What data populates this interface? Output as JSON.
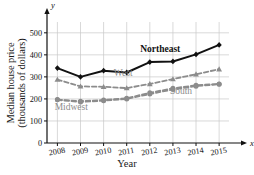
{
  "chart_data": {
    "type": "line",
    "title": "",
    "xlabel": "Year",
    "ylabel": "Median house price (thousands of dollars)",
    "ylabel_line1": "Median house price",
    "ylabel_line2": "(thousands of dollars)",
    "x_axis_symbol": "x",
    "y_axis_symbol": "y",
    "categories": [
      "2008",
      "2009",
      "2010",
      "2011",
      "2012",
      "2013",
      "2014",
      "2015"
    ],
    "x": [
      2008,
      2009,
      2010,
      2011,
      2012,
      2013,
      2014,
      2015
    ],
    "xlim": [
      2007.55,
      2015.6
    ],
    "ylim": [
      0,
      540
    ],
    "yticks": [
      "0",
      "100",
      "200",
      "300",
      "400",
      "500"
    ],
    "ytick_values": [
      0,
      100,
      200,
      300,
      400,
      500
    ],
    "grid": true,
    "legend": "inline-labels",
    "series": [
      {
        "name": "Northeast",
        "label": "Northeast",
        "style": "solid",
        "color": "#111111",
        "marker": "diamond",
        "label_x": 2012.45,
        "label_y": 415,
        "values": [
          340,
          300,
          328,
          320,
          367,
          370,
          402,
          445
        ]
      },
      {
        "name": "West",
        "label": "West",
        "style": "dashed",
        "color": "#8c8c8c",
        "marker": "triangle",
        "label_x": 2010.85,
        "label_y": 303,
        "values": [
          288,
          257,
          255,
          249,
          268,
          290,
          312,
          335
        ]
      },
      {
        "name": "South",
        "label": "South",
        "style": "dashed",
        "color": "#8c8c8c",
        "marker": "circle",
        "label_x": 2013.35,
        "label_y": 222,
        "values": [
          197,
          190,
          195,
          203,
          228,
          248,
          262,
          268
        ]
      },
      {
        "name": "Midwest",
        "label": "Midwest",
        "style": "dashed",
        "color": "#8c8c8c",
        "marker": "circle",
        "label_x": 2008.6,
        "label_y": 148,
        "values": [
          196,
          186,
          192,
          200,
          222,
          243,
          258,
          267
        ]
      }
    ]
  }
}
